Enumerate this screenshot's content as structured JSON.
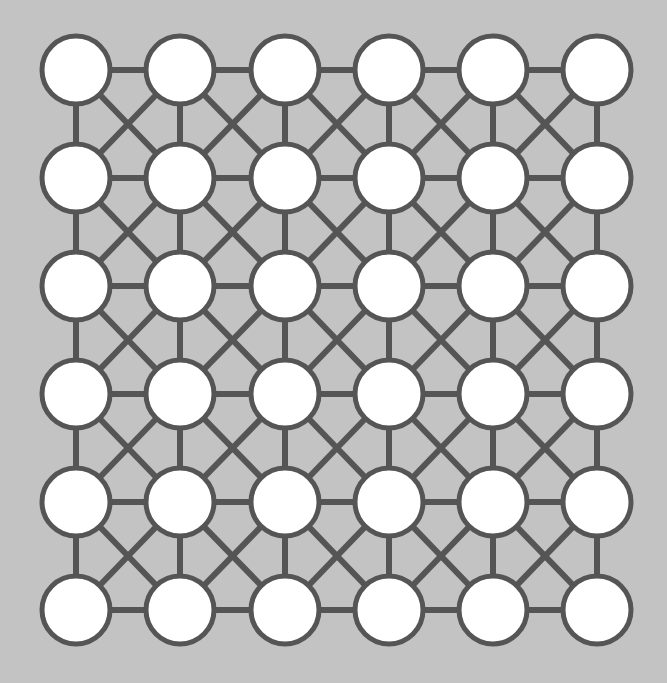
{
  "figure": {
    "title": "",
    "type": "graph-lattice-diagram",
    "background_color": "#c3c3c3",
    "node_fill_color": "#ffffff",
    "node_stroke_color": "#555555",
    "edge_color": "#555555",
    "node_radius": 34,
    "node_stroke_width": 5,
    "edge_width": 6,
    "grid_rows": 6,
    "grid_cols": 6,
    "node_count": 36,
    "edge_count": 110
  },
  "chart_data": {
    "type": "scatter",
    "title": "",
    "xlabel": "",
    "ylabel": "",
    "xlim": [
      0,
      667
    ],
    "ylim": [
      0,
      683
    ],
    "grid": false,
    "legend": "none",
    "col_centers_x": [
      76,
      180,
      285,
      389,
      493,
      597
    ],
    "row_centers_y": [
      70,
      178,
      286,
      394,
      502,
      610
    ],
    "nodes": [
      {
        "id": "n-0-0",
        "row": 0,
        "col": 0,
        "cx": 76,
        "cy": 70,
        "r": 34
      },
      {
        "id": "n-0-1",
        "row": 0,
        "col": 1,
        "cx": 180,
        "cy": 70,
        "r": 34
      },
      {
        "id": "n-0-2",
        "row": 0,
        "col": 2,
        "cx": 285,
        "cy": 70,
        "r": 34
      },
      {
        "id": "n-0-3",
        "row": 0,
        "col": 3,
        "cx": 389,
        "cy": 70,
        "r": 34
      },
      {
        "id": "n-0-4",
        "row": 0,
        "col": 4,
        "cx": 493,
        "cy": 70,
        "r": 34
      },
      {
        "id": "n-0-5",
        "row": 0,
        "col": 5,
        "cx": 597,
        "cy": 70,
        "r": 34
      },
      {
        "id": "n-1-0",
        "row": 1,
        "col": 0,
        "cx": 76,
        "cy": 178,
        "r": 34
      },
      {
        "id": "n-1-1",
        "row": 1,
        "col": 1,
        "cx": 180,
        "cy": 178,
        "r": 34
      },
      {
        "id": "n-1-2",
        "row": 1,
        "col": 2,
        "cx": 285,
        "cy": 178,
        "r": 34
      },
      {
        "id": "n-1-3",
        "row": 1,
        "col": 3,
        "cx": 389,
        "cy": 178,
        "r": 34
      },
      {
        "id": "n-1-4",
        "row": 1,
        "col": 4,
        "cx": 493,
        "cy": 178,
        "r": 34
      },
      {
        "id": "n-1-5",
        "row": 1,
        "col": 5,
        "cx": 597,
        "cy": 178,
        "r": 34
      },
      {
        "id": "n-2-0",
        "row": 2,
        "col": 0,
        "cx": 76,
        "cy": 286,
        "r": 34
      },
      {
        "id": "n-2-1",
        "row": 2,
        "col": 1,
        "cx": 180,
        "cy": 286,
        "r": 34
      },
      {
        "id": "n-2-2",
        "row": 2,
        "col": 2,
        "cx": 285,
        "cy": 286,
        "r": 34
      },
      {
        "id": "n-2-3",
        "row": 2,
        "col": 3,
        "cx": 389,
        "cy": 286,
        "r": 34
      },
      {
        "id": "n-2-4",
        "row": 2,
        "col": 4,
        "cx": 493,
        "cy": 286,
        "r": 34
      },
      {
        "id": "n-2-5",
        "row": 2,
        "col": 5,
        "cx": 597,
        "cy": 286,
        "r": 34
      },
      {
        "id": "n-3-0",
        "row": 3,
        "col": 0,
        "cx": 76,
        "cy": 394,
        "r": 34
      },
      {
        "id": "n-3-1",
        "row": 3,
        "col": 1,
        "cx": 180,
        "cy": 394,
        "r": 34
      },
      {
        "id": "n-3-2",
        "row": 3,
        "col": 2,
        "cx": 285,
        "cy": 394,
        "r": 34
      },
      {
        "id": "n-3-3",
        "row": 3,
        "col": 3,
        "cx": 389,
        "cy": 394,
        "r": 34
      },
      {
        "id": "n-3-4",
        "row": 3,
        "col": 4,
        "cx": 493,
        "cy": 394,
        "r": 34
      },
      {
        "id": "n-3-5",
        "row": 3,
        "col": 5,
        "cx": 597,
        "cy": 394,
        "r": 34
      },
      {
        "id": "n-4-0",
        "row": 4,
        "col": 0,
        "cx": 76,
        "cy": 502,
        "r": 34
      },
      {
        "id": "n-4-1",
        "row": 4,
        "col": 1,
        "cx": 180,
        "cy": 502,
        "r": 34
      },
      {
        "id": "n-4-2",
        "row": 4,
        "col": 2,
        "cx": 285,
        "cy": 502,
        "r": 34
      },
      {
        "id": "n-4-3",
        "row": 4,
        "col": 3,
        "cx": 389,
        "cy": 502,
        "r": 34
      },
      {
        "id": "n-4-4",
        "row": 4,
        "col": 4,
        "cx": 493,
        "cy": 502,
        "r": 34
      },
      {
        "id": "n-4-5",
        "row": 4,
        "col": 5,
        "cx": 597,
        "cy": 502,
        "r": 34
      },
      {
        "id": "n-5-0",
        "row": 5,
        "col": 0,
        "cx": 76,
        "cy": 610,
        "r": 34
      },
      {
        "id": "n-5-1",
        "row": 5,
        "col": 1,
        "cx": 180,
        "cy": 610,
        "r": 34
      },
      {
        "id": "n-5-2",
        "row": 5,
        "col": 2,
        "cx": 285,
        "cy": 610,
        "r": 34
      },
      {
        "id": "n-5-3",
        "row": 5,
        "col": 3,
        "cx": 389,
        "cy": 610,
        "r": 34
      },
      {
        "id": "n-5-4",
        "row": 5,
        "col": 4,
        "cx": 493,
        "cy": 610,
        "r": 34
      },
      {
        "id": "n-5-5",
        "row": 5,
        "col": 5,
        "cx": 597,
        "cy": 610,
        "r": 34
      }
    ],
    "edges": [
      [
        "n-0-0",
        "n-0-1"
      ],
      [
        "n-0-1",
        "n-0-2"
      ],
      [
        "n-0-2",
        "n-0-3"
      ],
      [
        "n-0-3",
        "n-0-4"
      ],
      [
        "n-0-4",
        "n-0-5"
      ],
      [
        "n-1-0",
        "n-1-1"
      ],
      [
        "n-1-1",
        "n-1-2"
      ],
      [
        "n-1-2",
        "n-1-3"
      ],
      [
        "n-1-3",
        "n-1-4"
      ],
      [
        "n-1-4",
        "n-1-5"
      ],
      [
        "n-2-0",
        "n-2-1"
      ],
      [
        "n-2-1",
        "n-2-2"
      ],
      [
        "n-2-2",
        "n-2-3"
      ],
      [
        "n-2-3",
        "n-2-4"
      ],
      [
        "n-2-4",
        "n-2-5"
      ],
      [
        "n-3-0",
        "n-3-1"
      ],
      [
        "n-3-1",
        "n-3-2"
      ],
      [
        "n-3-2",
        "n-3-3"
      ],
      [
        "n-3-3",
        "n-3-4"
      ],
      [
        "n-3-4",
        "n-3-5"
      ],
      [
        "n-4-0",
        "n-4-1"
      ],
      [
        "n-4-1",
        "n-4-2"
      ],
      [
        "n-4-2",
        "n-4-3"
      ],
      [
        "n-4-3",
        "n-4-4"
      ],
      [
        "n-4-4",
        "n-4-5"
      ],
      [
        "n-5-0",
        "n-5-1"
      ],
      [
        "n-5-1",
        "n-5-2"
      ],
      [
        "n-5-2",
        "n-5-3"
      ],
      [
        "n-5-3",
        "n-5-4"
      ],
      [
        "n-5-4",
        "n-5-5"
      ],
      [
        "n-0-0",
        "n-1-0"
      ],
      [
        "n-1-0",
        "n-2-0"
      ],
      [
        "n-2-0",
        "n-3-0"
      ],
      [
        "n-3-0",
        "n-4-0"
      ],
      [
        "n-4-0",
        "n-5-0"
      ],
      [
        "n-0-1",
        "n-1-1"
      ],
      [
        "n-1-1",
        "n-2-1"
      ],
      [
        "n-2-1",
        "n-3-1"
      ],
      [
        "n-3-1",
        "n-4-1"
      ],
      [
        "n-4-1",
        "n-5-1"
      ],
      [
        "n-0-2",
        "n-1-2"
      ],
      [
        "n-1-2",
        "n-2-2"
      ],
      [
        "n-2-2",
        "n-3-2"
      ],
      [
        "n-3-2",
        "n-4-2"
      ],
      [
        "n-4-2",
        "n-5-2"
      ],
      [
        "n-0-3",
        "n-1-3"
      ],
      [
        "n-1-3",
        "n-2-3"
      ],
      [
        "n-2-3",
        "n-3-3"
      ],
      [
        "n-3-3",
        "n-4-3"
      ],
      [
        "n-4-3",
        "n-5-3"
      ],
      [
        "n-0-4",
        "n-1-4"
      ],
      [
        "n-1-4",
        "n-2-4"
      ],
      [
        "n-2-4",
        "n-3-4"
      ],
      [
        "n-3-4",
        "n-4-4"
      ],
      [
        "n-4-4",
        "n-5-4"
      ],
      [
        "n-0-5",
        "n-1-5"
      ],
      [
        "n-1-5",
        "n-2-5"
      ],
      [
        "n-2-5",
        "n-3-5"
      ],
      [
        "n-3-5",
        "n-4-5"
      ],
      [
        "n-4-5",
        "n-5-5"
      ],
      [
        "n-0-0",
        "n-1-1"
      ],
      [
        "n-0-1",
        "n-1-2"
      ],
      [
        "n-0-2",
        "n-1-3"
      ],
      [
        "n-0-3",
        "n-1-4"
      ],
      [
        "n-0-4",
        "n-1-5"
      ],
      [
        "n-1-0",
        "n-2-1"
      ],
      [
        "n-1-1",
        "n-2-2"
      ],
      [
        "n-1-2",
        "n-2-3"
      ],
      [
        "n-1-3",
        "n-2-4"
      ],
      [
        "n-1-4",
        "n-2-5"
      ],
      [
        "n-2-0",
        "n-3-1"
      ],
      [
        "n-2-1",
        "n-3-2"
      ],
      [
        "n-2-2",
        "n-3-3"
      ],
      [
        "n-2-3",
        "n-3-4"
      ],
      [
        "n-2-4",
        "n-3-5"
      ],
      [
        "n-3-0",
        "n-4-1"
      ],
      [
        "n-3-1",
        "n-4-2"
      ],
      [
        "n-3-2",
        "n-4-3"
      ],
      [
        "n-3-3",
        "n-4-4"
      ],
      [
        "n-3-4",
        "n-4-5"
      ],
      [
        "n-4-0",
        "n-5-1"
      ],
      [
        "n-4-1",
        "n-5-2"
      ],
      [
        "n-4-2",
        "n-5-3"
      ],
      [
        "n-4-3",
        "n-5-4"
      ],
      [
        "n-4-4",
        "n-5-5"
      ],
      [
        "n-0-1",
        "n-1-0"
      ],
      [
        "n-0-2",
        "n-1-1"
      ],
      [
        "n-0-3",
        "n-1-2"
      ],
      [
        "n-0-4",
        "n-1-3"
      ],
      [
        "n-0-5",
        "n-1-4"
      ],
      [
        "n-1-1",
        "n-2-0"
      ],
      [
        "n-1-2",
        "n-2-1"
      ],
      [
        "n-1-3",
        "n-2-2"
      ],
      [
        "n-1-4",
        "n-2-3"
      ],
      [
        "n-1-5",
        "n-2-4"
      ],
      [
        "n-2-1",
        "n-3-0"
      ],
      [
        "n-2-2",
        "n-3-1"
      ],
      [
        "n-2-3",
        "n-3-2"
      ],
      [
        "n-2-4",
        "n-3-3"
      ],
      [
        "n-2-5",
        "n-3-4"
      ],
      [
        "n-3-1",
        "n-4-0"
      ],
      [
        "n-3-2",
        "n-4-1"
      ],
      [
        "n-3-3",
        "n-4-2"
      ],
      [
        "n-3-4",
        "n-4-3"
      ],
      [
        "n-3-5",
        "n-4-4"
      ],
      [
        "n-4-1",
        "n-5-0"
      ],
      [
        "n-4-2",
        "n-5-1"
      ],
      [
        "n-4-3",
        "n-5-2"
      ],
      [
        "n-4-4",
        "n-5-3"
      ],
      [
        "n-4-5",
        "n-5-4"
      ]
    ]
  }
}
